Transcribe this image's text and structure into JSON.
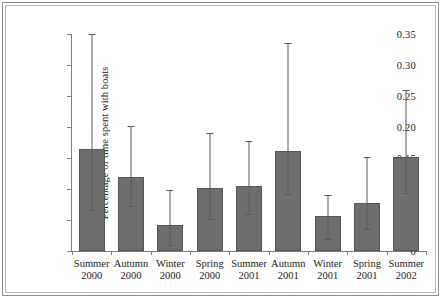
{
  "chart_data": {
    "type": "bar",
    "title": "",
    "xlabel": "",
    "ylabel": "Percentage of time spent with boats",
    "ylim": [
      0,
      0.35
    ],
    "yticks": [
      "0",
      "0.05",
      "0.10",
      "0.15",
      "0.20",
      "0.25",
      "0.30",
      "0.35"
    ],
    "ytick_values": [
      0,
      0.05,
      0.1,
      0.15,
      0.2,
      0.25,
      0.3,
      0.35
    ],
    "grid": false,
    "legend": null,
    "bar_color": "#6e6e6e",
    "error_color": "#5a5a5a",
    "categories": [
      "Summer 2000",
      "Autumn 2000",
      "Winter 2000",
      "Spring 2000",
      "Summer 2001",
      "Autumn 2001",
      "Winter 2001",
      "Spring 2001",
      "Summer 2002"
    ],
    "category_lines": [
      {
        "season": "Summer",
        "year": "2000"
      },
      {
        "season": "Autumn",
        "year": "2000"
      },
      {
        "season": "Winter",
        "year": "2000"
      },
      {
        "season": "Spring",
        "year": "2000"
      },
      {
        "season": "Summer",
        "year": "2001"
      },
      {
        "season": "Autumn",
        "year": "2001"
      },
      {
        "season": "Winter",
        "year": "2001"
      },
      {
        "season": "Spring",
        "year": "2001"
      },
      {
        "season": "Summer",
        "year": "2002"
      }
    ],
    "values": [
      0.165,
      0.12,
      0.042,
      0.102,
      0.105,
      0.162,
      0.056,
      0.078,
      0.152
    ],
    "error_low": [
      0.066,
      0.072,
      0.009,
      0.051,
      0.06,
      0.092,
      0.02,
      0.036,
      0.093
    ],
    "error_high": [
      0.35,
      0.202,
      0.098,
      0.19,
      0.177,
      0.335,
      0.09,
      0.152,
      0.26
    ]
  }
}
